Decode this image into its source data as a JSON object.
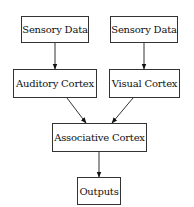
{
  "diagram": {
    "type": "flowchart",
    "direction": "top-to-bottom",
    "colors": {
      "node_border": "#333333",
      "node_fill": "#ffffff",
      "edge": "#333333",
      "text": "#111111"
    },
    "nodes": [
      {
        "id": "sensory1",
        "label": "Sensory Data",
        "x": 21,
        "y": 16,
        "w": 68,
        "h": 27
      },
      {
        "id": "sensory2",
        "label": "Sensory Data",
        "x": 110,
        "y": 16,
        "w": 68,
        "h": 27
      },
      {
        "id": "auditory",
        "label": "Auditory Cortex",
        "x": 13,
        "y": 69,
        "w": 84,
        "h": 29
      },
      {
        "id": "visual",
        "label": "Visual Cortex",
        "x": 109,
        "y": 69,
        "w": 71,
        "h": 29
      },
      {
        "id": "associative",
        "label": "Associative Cortex",
        "x": 52,
        "y": 123,
        "w": 95,
        "h": 29
      },
      {
        "id": "outputs",
        "label": "Outputs",
        "x": 77,
        "y": 177,
        "w": 44,
        "h": 28
      }
    ],
    "edges": [
      {
        "from": "sensory1",
        "to": "auditory"
      },
      {
        "from": "sensory2",
        "to": "visual"
      },
      {
        "from": "auditory",
        "to": "associative"
      },
      {
        "from": "visual",
        "to": "associative"
      },
      {
        "from": "associative",
        "to": "outputs"
      }
    ]
  }
}
